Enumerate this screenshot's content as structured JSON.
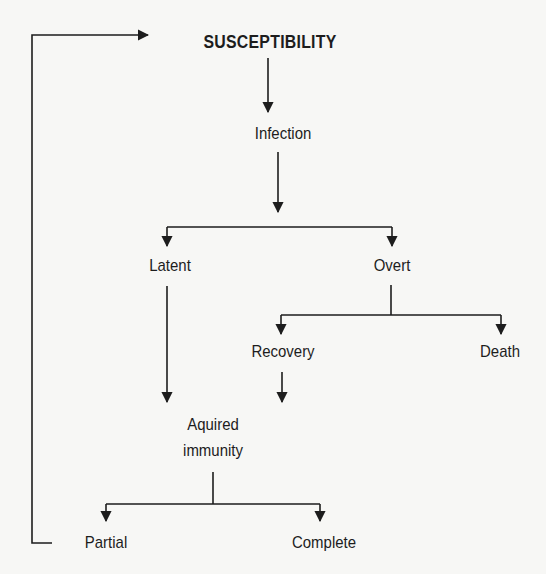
{
  "diagram": {
    "nodes": {
      "susceptibility": "SUSCEPTIBILITY",
      "infection": "Infection",
      "latent": "Latent",
      "overt": "Overt",
      "recovery": "Recovery",
      "death": "Death",
      "acquired_immunity": "Aquired\nimmunity",
      "partial": "Partial",
      "complete": "Complete"
    },
    "edges": [
      {
        "from": "susceptibility",
        "to": "infection"
      },
      {
        "from": "infection",
        "to": "latent"
      },
      {
        "from": "infection",
        "to": "overt"
      },
      {
        "from": "overt",
        "to": "recovery"
      },
      {
        "from": "overt",
        "to": "death"
      },
      {
        "from": "latent",
        "to": "acquired_immunity"
      },
      {
        "from": "recovery",
        "to": "acquired_immunity"
      },
      {
        "from": "acquired_immunity",
        "to": "partial"
      },
      {
        "from": "acquired_immunity",
        "to": "complete"
      },
      {
        "from": "partial",
        "to": "susceptibility",
        "type": "feedback-loop"
      }
    ],
    "colors": {
      "line": "#1d1d1d",
      "background": "#f7f7f5"
    }
  }
}
